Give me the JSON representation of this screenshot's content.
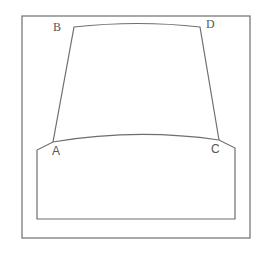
{
  "diagram": {
    "labels": {
      "A": "A",
      "B": "B",
      "C": "C",
      "D": "D"
    },
    "colors": {
      "stroke": "#6e6e6e",
      "frame": "#7a7a7a",
      "label": "#555555",
      "background": "#ffffff"
    }
  }
}
